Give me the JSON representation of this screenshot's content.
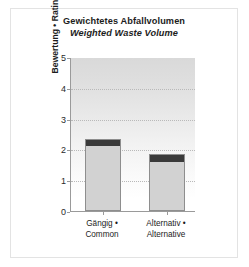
{
  "chart_data": {
    "type": "bar",
    "title": "Gewichtetes Abfallvolumen",
    "subtitle": "Weighted Waste Volume",
    "xlabel": "",
    "ylabel": "Bewertung • Rating",
    "ylim": [
      0,
      5
    ],
    "yticks": [
      "0",
      "1",
      "2",
      "3",
      "4",
      "5"
    ],
    "grid": true,
    "legend": null,
    "categories": [
      "Gängig • Common",
      "Alternativ • Alternative"
    ],
    "category_lines": [
      [
        "Gängig •",
        "Common"
      ],
      [
        "Alternativ •",
        "Alternative"
      ]
    ],
    "values": [
      2.35,
      1.85
    ],
    "series": [
      {
        "name": "Weighted Waste Volume",
        "values": [
          2.35,
          1.85
        ]
      }
    ],
    "bar_cap_height": 0.2,
    "colors": {
      "bar_fill": "#d2d2d2",
      "bar_cap": "#3a3a3a",
      "bar_border": "#8e8e8e",
      "axis": "#9a9a9a",
      "gridline": "#b9b9b9",
      "text": "#1c1c1c",
      "plot_bg_top": "#d9d9d9",
      "plot_bg_bottom": "#ffffff",
      "frame": "#e3e3e3"
    }
  }
}
